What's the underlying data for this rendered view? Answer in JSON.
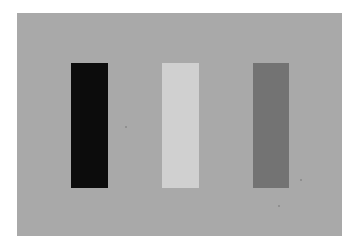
{
  "scene": {
    "background": "#ffffff",
    "panel": {
      "color": "#a9a9a9"
    },
    "bars": [
      {
        "name": "black-bar",
        "color": "#0c0c0c"
      },
      {
        "name": "light-gray-bar",
        "color": "#d0d0d0"
      },
      {
        "name": "medium-gray-bar",
        "color": "#737373"
      }
    ]
  }
}
